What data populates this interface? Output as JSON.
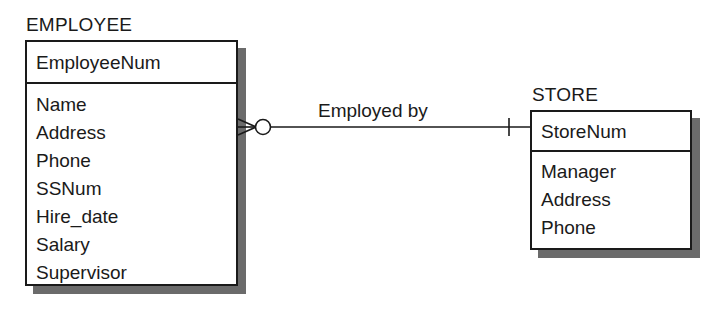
{
  "diagram": {
    "type": "entity-relationship-diagram",
    "notation": "crows-foot",
    "background_color": "#ffffff",
    "line_color": "#1a1a1a",
    "shadow_color": "#6b6b6b"
  },
  "entities": [
    {
      "name": "EMPLOYEE",
      "key_attribute": "EmployeeNum",
      "attributes": [
        "Name",
        "Address",
        "Phone",
        "SSNum",
        "Hire_date",
        "Salary",
        "Supervisor"
      ]
    },
    {
      "name": "STORE",
      "key_attribute": "StoreNum",
      "attributes": [
        "Manager",
        "Address",
        "Phone"
      ]
    }
  ],
  "relationship": {
    "label": "Employed by",
    "from_entity": "EMPLOYEE",
    "to_entity": "STORE",
    "from_cardinality": "zero-or-many",
    "to_cardinality": "exactly-one",
    "from_symbol": "crows-foot-circle",
    "to_symbol": "single-tick"
  }
}
